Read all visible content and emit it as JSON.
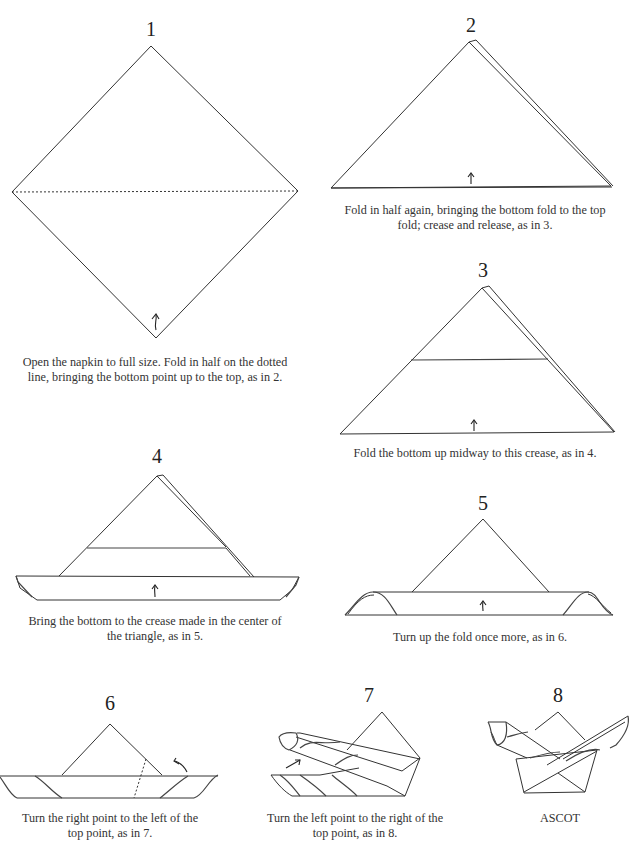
{
  "steps": [
    {
      "number": "1",
      "caption_lines": [
        "Open the napkin to full size. Fold in half on the dotted",
        "line, bringing the bottom point up to the top, as in 2."
      ]
    },
    {
      "number": "2",
      "caption_lines": [
        "Fold in half again, bringing the bottom fold to the top",
        "fold; crease and release, as in 3."
      ]
    },
    {
      "number": "3",
      "caption_lines": [
        "Fold the bottom up midway to this crease, as in 4."
      ]
    },
    {
      "number": "4",
      "caption_lines": [
        "Bring the bottom to the crease made in the center of",
        "the triangle, as in 5."
      ]
    },
    {
      "number": "5",
      "caption_lines": [
        "Turn up the fold once more, as in 6."
      ]
    },
    {
      "number": "6",
      "caption_lines": [
        "Turn the right point to the left of the",
        "top point, as in 7."
      ]
    },
    {
      "number": "7",
      "caption_lines": [
        "Turn the left point to the right of the",
        "top point, as in 8."
      ]
    },
    {
      "number": "8",
      "caption_lines": [
        "ASCOT"
      ]
    }
  ],
  "icons": {
    "fold_arrow": "up-arrow",
    "turn_arrow": "curved-arrow"
  }
}
